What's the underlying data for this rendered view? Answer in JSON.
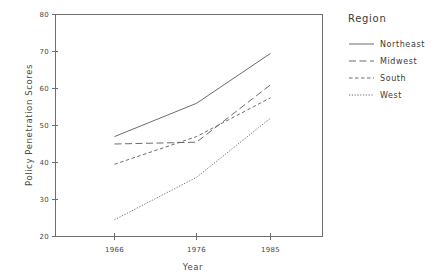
{
  "chart_data": {
    "type": "line",
    "title": "",
    "xlabel": "Year",
    "ylabel": "Policy Penetration Scores",
    "categories": [
      "1966",
      "1976",
      "1985"
    ],
    "x": [
      1966,
      1976,
      1985
    ],
    "xlim": [
      1961,
      1990
    ],
    "ylim": [
      20,
      80
    ],
    "yticks": [
      "20",
      "30",
      "40",
      "50",
      "60",
      "70",
      "80"
    ],
    "ytick_values": [
      20,
      30,
      40,
      50,
      60,
      70,
      80
    ],
    "xticks": [
      "1966",
      "1976",
      "1985"
    ],
    "grid": false,
    "legend_position": "right",
    "legend_title": "Region",
    "series": [
      {
        "name": "Northeast",
        "style": "solid",
        "values": [
          47.0,
          56.0,
          69.5
        ]
      },
      {
        "name": "Midwest",
        "style": "long",
        "values": [
          45.0,
          45.5,
          61.0
        ]
      },
      {
        "name": "South",
        "style": "medium",
        "values": [
          39.5,
          47.0,
          57.5
        ]
      },
      {
        "name": "West",
        "style": "dotted",
        "values": [
          24.5,
          36.0,
          52.0
        ]
      }
    ]
  },
  "legend": {
    "title": "Region",
    "entries": [
      {
        "label": "Northeast"
      },
      {
        "label": "Midwest"
      },
      {
        "label": "South"
      },
      {
        "label": "West"
      }
    ]
  },
  "axes": {
    "x_title": "Year",
    "y_title": "Policy Penetration Scores",
    "x_tick_labels": [
      "1966",
      "1976",
      "1985"
    ],
    "y_tick_labels": [
      "80",
      "70",
      "60",
      "50",
      "40",
      "30",
      "20"
    ]
  }
}
